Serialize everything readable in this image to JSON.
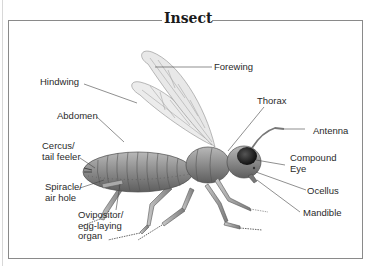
{
  "diagram": {
    "title": "Insect",
    "labels": {
      "forewing": "Forewing",
      "hindwing": "Hindwing",
      "abdomen": "Abdomen",
      "thorax": "Thorax",
      "antenna": "Antenna",
      "cercus": "Cercus/\ntail feeler",
      "compound_eye": "Compound\nEye",
      "spiracle": "Spiracle/\nair hole",
      "ocellus": "Ocellus",
      "ovipositor": "Ovipositor/\negg-laying\norgan",
      "mandible": "Mandible"
    },
    "colors": {
      "frame": "#8a8a8a",
      "body": "#8f8f8f",
      "wing": "#e6e6e6",
      "leader_line": "#444444"
    }
  }
}
